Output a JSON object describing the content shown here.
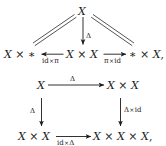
{
  "figure": {
    "background": "#ffffff",
    "ink": "#1c1c1c",
    "diagrams": [
      {
        "name": "unit-law-triangle",
        "apex": "X",
        "center_vertical_arrow_label": "Δ",
        "left_object": "X × ∗",
        "center_object": "X × X",
        "right_object": "∗ × X",
        "right_object_trailing": ",",
        "left_arrow_label_head": "id",
        "left_arrow_label_times": "×",
        "left_arrow_label_tail": "π",
        "right_arrow_label_head": "π",
        "right_arrow_label_times": "×",
        "right_arrow_label_tail": "id",
        "left_diagonal_style": "double-line-equality",
        "right_diagonal_style": "double-line-equality"
      },
      {
        "name": "coassociativity-square",
        "top_left_object": "X",
        "top_right_object": "X × X",
        "bottom_left_object": "X × X",
        "bottom_right_object": "X × X × X",
        "bottom_right_trailing": ",",
        "top_arrow_label": "Δ",
        "left_arrow_label": "Δ",
        "right_arrow_label_head": "Δ",
        "right_arrow_label_times": "×",
        "right_arrow_label_tail": "id",
        "bottom_arrow_label_head": "id",
        "bottom_arrow_label_times": "×",
        "bottom_arrow_label_tail": "Δ"
      }
    ]
  },
  "glyphs": {
    "times": "×",
    "delta": "Δ",
    "pi": "π",
    "star": "∗",
    "comma": ","
  }
}
